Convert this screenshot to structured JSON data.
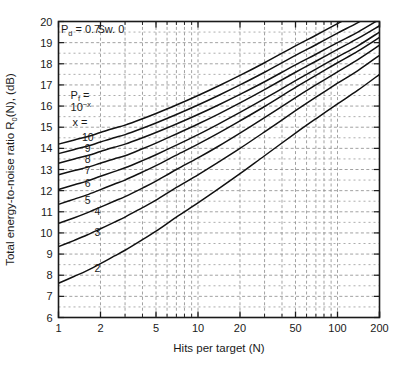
{
  "chart_data": {
    "type": "line",
    "title": "",
    "xlabel": "Hits per target (N)",
    "ylabel": "Total energy-to-noise ratio  R0(N),  (dB)",
    "ylabel_parts": {
      "lead": "Total energy-to-noise ratio",
      "symbol": "R",
      "symbol_sub": "0",
      "symbol_tail": "(N),",
      "units": "(dB)"
    },
    "xscale": "log",
    "yscale": "linear",
    "xlim": [
      1,
      200
    ],
    "ylim": [
      6,
      20
    ],
    "grid": true,
    "grid_style": "dashed",
    "legend_position": "inline-curve-labels",
    "xticks": [
      1,
      2,
      5,
      10,
      20,
      50,
      100,
      200
    ],
    "xticklabels": [
      "1",
      "2",
      "5",
      "10",
      "20",
      "50",
      "100",
      "200"
    ],
    "yticks": [
      6,
      7,
      8,
      9,
      10,
      11,
      12,
      13,
      14,
      15,
      16,
      17,
      18,
      19,
      20
    ],
    "yticklabels": [
      "6",
      "7",
      "8",
      "9",
      "10",
      "11",
      "12",
      "13",
      "14",
      "15",
      "16",
      "17",
      "18",
      "19",
      "20"
    ],
    "annotations": [
      {
        "name": "pd-annotation",
        "text": "Pd = 0.7",
        "parts": {
          "sym": "P",
          "sub": "d",
          "rest": " = 0.7"
        },
        "x": 1.04,
        "y": 19.45
      },
      {
        "name": "swerling-annotation",
        "text": "Sw. 0",
        "x": 1.9,
        "y": 19.45
      },
      {
        "name": "pf-annotation",
        "text": "Pf =",
        "parts": {
          "sym": "P",
          "sub": "f",
          "rest": " ="
        },
        "x": 1.22,
        "y": 16.35
      },
      {
        "name": "pf-power-annotation",
        "text": "10-x",
        "parts": {
          "base": "10",
          "exp": "−x"
        },
        "x": 1.22,
        "y": 15.75
      },
      {
        "name": "x-equals-annotation",
        "text": "x =",
        "x": 1.26,
        "y": 15.05
      }
    ],
    "series": [
      {
        "name": "x = 10",
        "label": "10",
        "label_x": 1.62,
        "label_y": 14.5,
        "x": [
          1,
          1.3,
          1.6,
          2,
          2.5,
          3,
          4,
          5,
          7,
          10,
          14,
          20,
          30,
          50,
          70,
          100,
          140,
          200
        ],
        "values": [
          14.2,
          14.4,
          14.55,
          14.75,
          14.95,
          15.1,
          15.4,
          15.65,
          16.05,
          16.5,
          16.95,
          17.45,
          18.05,
          18.85,
          19.35,
          19.9,
          20.4,
          21.0
        ]
      },
      {
        "name": "x = 9",
        "label": "9",
        "label_x": 1.62,
        "label_y": 14.0,
        "x": [
          1,
          1.3,
          1.6,
          2,
          2.5,
          3,
          4,
          5,
          7,
          10,
          14,
          20,
          30,
          50,
          70,
          100,
          140,
          200
        ],
        "values": [
          13.75,
          13.95,
          14.1,
          14.3,
          14.5,
          14.65,
          14.95,
          15.2,
          15.6,
          16.05,
          16.5,
          17.0,
          17.6,
          18.4,
          18.9,
          19.45,
          19.95,
          20.55
        ]
      },
      {
        "name": "x = 8",
        "label": "8",
        "label_x": 1.62,
        "label_y": 13.45,
        "x": [
          1,
          1.3,
          1.6,
          2,
          2.5,
          3,
          4,
          5,
          7,
          10,
          14,
          20,
          30,
          50,
          70,
          100,
          140,
          200
        ],
        "values": [
          13.3,
          13.5,
          13.65,
          13.85,
          14.05,
          14.2,
          14.5,
          14.75,
          15.15,
          15.6,
          16.05,
          16.55,
          17.15,
          17.95,
          18.45,
          19.0,
          19.5,
          20.1
        ]
      },
      {
        "name": "x = 7",
        "label": "7",
        "label_x": 1.62,
        "label_y": 12.95,
        "x": [
          1,
          1.3,
          1.6,
          2,
          2.5,
          3,
          4,
          5,
          7,
          10,
          14,
          20,
          30,
          50,
          70,
          100,
          140,
          200
        ],
        "values": [
          12.75,
          12.95,
          13.1,
          13.3,
          13.5,
          13.65,
          13.98,
          14.25,
          14.68,
          15.15,
          15.62,
          16.15,
          16.78,
          17.6,
          18.12,
          18.68,
          19.2,
          19.8
        ]
      },
      {
        "name": "x = 6",
        "label": "6",
        "label_x": 1.62,
        "label_y": 12.35,
        "x": [
          1,
          1.3,
          1.6,
          2,
          2.5,
          3,
          4,
          5,
          7,
          10,
          14,
          20,
          30,
          50,
          70,
          100,
          140,
          200
        ],
        "values": [
          12.05,
          12.28,
          12.45,
          12.68,
          12.9,
          13.08,
          13.42,
          13.7,
          14.15,
          14.65,
          15.15,
          15.7,
          16.35,
          17.2,
          17.75,
          18.32,
          18.85,
          19.5
        ]
      },
      {
        "name": "x = 5",
        "label": "5",
        "label_x": 1.62,
        "label_y": 11.55,
        "x": [
          1,
          1.3,
          1.6,
          2,
          2.5,
          3,
          4,
          5,
          7,
          10,
          14,
          20,
          30,
          50,
          70,
          100,
          140,
          200
        ],
        "values": [
          11.35,
          11.6,
          11.8,
          12.05,
          12.3,
          12.5,
          12.88,
          13.18,
          13.68,
          14.2,
          14.72,
          15.3,
          15.98,
          16.88,
          17.45,
          18.05,
          18.6,
          19.25
        ]
      },
      {
        "name": "x = 4",
        "label": "4",
        "label_x": 1.9,
        "label_y": 11.0,
        "x": [
          1,
          1.3,
          1.6,
          2,
          2.5,
          3,
          4,
          5,
          7,
          10,
          14,
          20,
          30,
          50,
          70,
          100,
          140,
          200
        ],
        "values": [
          10.45,
          10.72,
          10.95,
          11.22,
          11.5,
          11.72,
          12.12,
          12.45,
          13.0,
          13.55,
          14.1,
          14.72,
          15.45,
          16.4,
          17.0,
          17.62,
          18.2,
          18.88
        ]
      },
      {
        "name": "x = 3",
        "label": "3",
        "label_x": 1.9,
        "label_y": 10.0,
        "x": [
          1,
          1.3,
          1.6,
          2,
          2.5,
          3,
          4,
          5,
          7,
          10,
          14,
          20,
          30,
          50,
          70,
          100,
          140,
          200
        ],
        "values": [
          9.35,
          9.65,
          9.9,
          10.2,
          10.5,
          10.75,
          11.2,
          11.55,
          12.15,
          12.75,
          13.35,
          14.0,
          14.78,
          15.78,
          16.42,
          17.08,
          17.68,
          18.4
        ]
      },
      {
        "name": "x = 2",
        "label": "2",
        "label_x": 1.9,
        "label_y": 8.3,
        "x": [
          1,
          1.3,
          1.6,
          2,
          2.5,
          3,
          4,
          5,
          7,
          10,
          14,
          20,
          30,
          50,
          70,
          100,
          140,
          200
        ],
        "values": [
          7.62,
          7.95,
          8.22,
          8.55,
          8.9,
          9.18,
          9.68,
          10.08,
          10.75,
          11.42,
          12.08,
          12.8,
          13.65,
          14.72,
          15.4,
          16.1,
          16.75,
          17.5
        ]
      }
    ]
  },
  "style": {
    "line_color": "#111111",
    "grid_color": "#8a8a8a",
    "axis_color": "#1a1a1a",
    "background": "#ffffff"
  }
}
